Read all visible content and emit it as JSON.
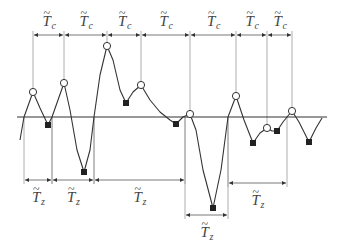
{
  "diagram": {
    "colors": {
      "line": "#333333",
      "guide": "#999999",
      "text": "#444444",
      "marker_fill": "#222222"
    },
    "baseline": {
      "y": 117,
      "x1": 17,
      "x2": 327
    },
    "waveform_points": [
      [
        20,
        140
      ],
      [
        24,
        117
      ],
      [
        33,
        92
      ],
      [
        40,
        108
      ],
      [
        48,
        125
      ],
      [
        52,
        117
      ],
      [
        64,
        83
      ],
      [
        70,
        110
      ],
      [
        77,
        150
      ],
      [
        84,
        172
      ],
      [
        90,
        150
      ],
      [
        94,
        117
      ],
      [
        100,
        75
      ],
      [
        107,
        46
      ],
      [
        113,
        60
      ],
      [
        120,
        90
      ],
      [
        126,
        103
      ],
      [
        133,
        92
      ],
      [
        141,
        85
      ],
      [
        150,
        100
      ],
      [
        160,
        112
      ],
      [
        170,
        120
      ],
      [
        176,
        124
      ],
      [
        183,
        117
      ],
      [
        190,
        114
      ],
      [
        196,
        130
      ],
      [
        203,
        170
      ],
      [
        213,
        208
      ],
      [
        221,
        170
      ],
      [
        228,
        117
      ],
      [
        236,
        96
      ],
      [
        244,
        120
      ],
      [
        253,
        143
      ],
      [
        260,
        133
      ],
      [
        267,
        128
      ],
      [
        272,
        131
      ],
      [
        277,
        131
      ],
      [
        283,
        122
      ],
      [
        287,
        117
      ],
      [
        292,
        111
      ],
      [
        299,
        122
      ],
      [
        309,
        142
      ],
      [
        316,
        128
      ],
      [
        322,
        118
      ]
    ],
    "crests": [
      {
        "x": 33,
        "y": 92
      },
      {
        "x": 64,
        "y": 83
      },
      {
        "x": 107,
        "y": 46
      },
      {
        "x": 141,
        "y": 85
      },
      {
        "x": 190,
        "y": 114
      },
      {
        "x": 236,
        "y": 96
      },
      {
        "x": 267,
        "y": 128
      },
      {
        "x": 292,
        "y": 111
      }
    ],
    "troughs": [
      {
        "x": 48,
        "y": 125
      },
      {
        "x": 84,
        "y": 172
      },
      {
        "x": 126,
        "y": 103
      },
      {
        "x": 176,
        "y": 124
      },
      {
        "x": 213,
        "y": 208
      },
      {
        "x": 253,
        "y": 143
      },
      {
        "x": 277,
        "y": 131
      },
      {
        "x": 309,
        "y": 142
      }
    ],
    "crest_periods": {
      "label_main": "T",
      "label_sub": "c",
      "arrow_y": 35,
      "intervals": [
        [
          33,
          64
        ],
        [
          64,
          107
        ],
        [
          107,
          141
        ],
        [
          141,
          190
        ],
        [
          190,
          236
        ],
        [
          236,
          267
        ],
        [
          267,
          292
        ]
      ]
    },
    "zero_periods": {
      "label_main": "T",
      "label_sub": "z",
      "intervals": [
        {
          "x1": 24,
          "x2": 52,
          "y": 180
        },
        {
          "x1": 52,
          "x2": 94,
          "y": 180
        },
        {
          "x1": 94,
          "x2": 185,
          "y": 180
        },
        {
          "x1": 185,
          "x2": 228,
          "y": 215
        },
        {
          "x1": 228,
          "x2": 287,
          "y": 183
        }
      ]
    }
  }
}
